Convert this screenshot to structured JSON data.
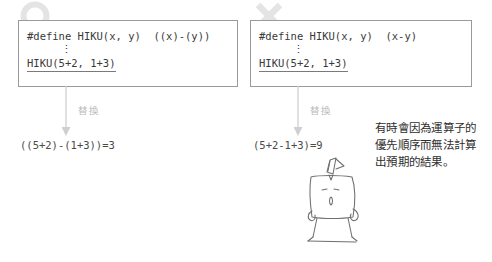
{
  "figure": {
    "panels": [
      {
        "id": "good",
        "mark": "circle-mark",
        "mark_meaning": "correct",
        "code": {
          "define_line": "#define HIKU(x, y)  ((x)-(y))",
          "ellipsis": "⋮",
          "call_line": "HIKU(5+2, 1+3)"
        },
        "substitution_label": "替換",
        "result": "((5+2)-(1+3))=3"
      },
      {
        "id": "bad",
        "mark": "cross-mark",
        "mark_meaning": "incorrect",
        "code": {
          "define_line": "#define HIKU(x, y)  (x-y)",
          "ellipsis": "⋮",
          "call_line": "HIKU(5+2, 1+3)"
        },
        "substitution_label": "替換",
        "result": "(5+2-1+3)=9"
      }
    ],
    "caption": "有時會因為運算子的優先順序而無法計算出預期的結果。",
    "mascot": "surprised-character-illustration",
    "colors": {
      "background": "#ffffff",
      "box_border": "#9a9a9a",
      "code_text": "#3a3a3a",
      "result_text": "#4a4a4a",
      "arrow": "#c8c8c8",
      "subst_label": "#b9b9b9",
      "mark": "#e3e3e3",
      "caption_text": "#2e2e2e",
      "mascot_ink": "#6f6f6f"
    }
  }
}
